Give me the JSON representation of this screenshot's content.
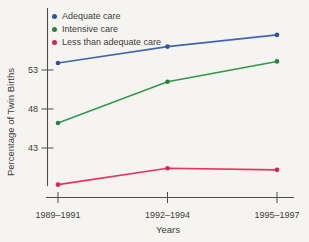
{
  "figure": {
    "background": "#f5f4f0",
    "text_color": "#3c3c3c",
    "axis_color": "#4e4e4e"
  },
  "chart_data": {
    "type": "line",
    "title": "",
    "xlabel": "Years",
    "ylabel": "Percentage of Twin Births",
    "categories": [
      "1989–1991",
      "1992–1994",
      "1995–1997"
    ],
    "series": [
      {
        "name": "Adequate care",
        "color": "#4066ae",
        "marker_color": "#33519c",
        "values": [
          53.9,
          56.0,
          57.5
        ]
      },
      {
        "name": "Intensive care",
        "color": "#33984b",
        "marker_color": "#27813c",
        "values": [
          46.2,
          51.5,
          54.1
        ]
      },
      {
        "name": "Less than adequate care",
        "color": "#ea3162",
        "marker_color": "#d92355",
        "values": [
          38.3,
          40.4,
          40.2
        ]
      }
    ],
    "yticks": [
      43,
      48,
      53
    ],
    "ylim": [
      37.5,
      58.5
    ],
    "legend_position": "top-left",
    "grid": false,
    "markers": true
  }
}
